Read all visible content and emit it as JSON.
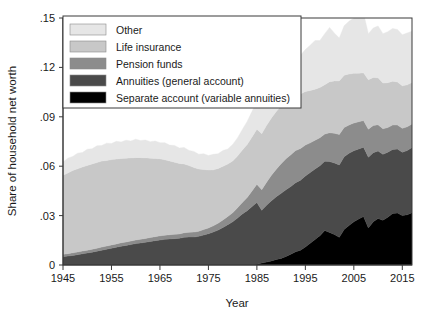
{
  "chart_data": {
    "type": "area",
    "stacked": true,
    "title": "",
    "xlabel": "Year",
    "ylabel": "Share of household net worth",
    "xlim": [
      1945,
      2017
    ],
    "ylim": [
      0,
      0.15
    ],
    "xticks": [
      1945,
      1955,
      1965,
      1975,
      1985,
      1995,
      2005,
      2015
    ],
    "xtick_labels": [
      "1945",
      "1955",
      "1965",
      "1975",
      "1985",
      "1995",
      "2005",
      "2015"
    ],
    "yticks": [
      0,
      0.03,
      0.06,
      0.09,
      0.12,
      0.15
    ],
    "ytick_labels": [
      "0",
      ".03",
      ".06",
      ".09",
      ".12",
      ".15"
    ],
    "grid": false,
    "legend_position": "top-left",
    "stack_order_bottom_to_top": [
      "Separate account (variable annuities)",
      "Annuities (general account)",
      "Pension funds",
      "Life insurance",
      "Other"
    ],
    "x": [
      1945,
      1946,
      1947,
      1948,
      1949,
      1950,
      1951,
      1952,
      1953,
      1954,
      1955,
      1956,
      1957,
      1958,
      1959,
      1960,
      1961,
      1962,
      1963,
      1964,
      1965,
      1966,
      1967,
      1968,
      1969,
      1970,
      1971,
      1972,
      1973,
      1974,
      1975,
      1976,
      1977,
      1978,
      1979,
      1980,
      1981,
      1982,
      1983,
      1984,
      1985,
      1986,
      1987,
      1988,
      1989,
      1990,
      1991,
      1992,
      1993,
      1994,
      1995,
      1996,
      1997,
      1998,
      1999,
      2000,
      2001,
      2002,
      2003,
      2004,
      2005,
      2006,
      2007,
      2008,
      2009,
      2010,
      2011,
      2012,
      2013,
      2014,
      2015,
      2016,
      2017
    ],
    "series": [
      {
        "name": "Separate account (variable annuities)",
        "color": "#000000",
        "values": [
          0,
          0,
          0,
          0,
          0,
          0,
          0,
          0,
          0,
          0,
          0,
          0,
          0,
          0,
          0,
          0,
          0,
          0,
          0,
          0,
          0,
          0,
          0,
          0,
          0,
          0,
          0,
          0,
          0,
          0,
          0,
          0,
          0,
          0,
          0,
          0,
          0,
          0,
          0,
          0,
          0.0005,
          0.0012,
          0.0018,
          0.0025,
          0.0034,
          0.004,
          0.0052,
          0.0065,
          0.008,
          0.009,
          0.011,
          0.0132,
          0.0155,
          0.0178,
          0.021,
          0.0198,
          0.0185,
          0.0168,
          0.0215,
          0.024,
          0.0262,
          0.028,
          0.0295,
          0.0225,
          0.0262,
          0.0282,
          0.0272,
          0.029,
          0.0312,
          0.0316,
          0.03,
          0.0305,
          0.0318
        ]
      },
      {
        "name": "Annuities (general account)",
        "color": "#4a4a4a",
        "values": [
          0.005,
          0.0054,
          0.0058,
          0.0063,
          0.0068,
          0.0073,
          0.0078,
          0.0084,
          0.009,
          0.0096,
          0.0102,
          0.0108,
          0.0114,
          0.0119,
          0.0124,
          0.013,
          0.0134,
          0.0138,
          0.0143,
          0.0148,
          0.0152,
          0.0156,
          0.0158,
          0.016,
          0.0162,
          0.0168,
          0.017,
          0.017,
          0.0174,
          0.0182,
          0.019,
          0.02,
          0.0212,
          0.0228,
          0.0245,
          0.0262,
          0.0285,
          0.031,
          0.033,
          0.0355,
          0.0375,
          0.032,
          0.0345,
          0.0365,
          0.038,
          0.0395,
          0.0405,
          0.0412,
          0.042,
          0.0425,
          0.043,
          0.043,
          0.0428,
          0.0425,
          0.042,
          0.043,
          0.0435,
          0.044,
          0.0442,
          0.0438,
          0.0432,
          0.0425,
          0.042,
          0.043,
          0.042,
          0.041,
          0.04,
          0.0395,
          0.039,
          0.0388,
          0.0385,
          0.039,
          0.0395
        ]
      },
      {
        "name": "Pension funds",
        "color": "#8c8c8c",
        "values": [
          0.0015,
          0.0015,
          0.0016,
          0.0016,
          0.0017,
          0.0017,
          0.0018,
          0.0018,
          0.0019,
          0.0019,
          0.002,
          0.002,
          0.0021,
          0.0021,
          0.0022,
          0.0022,
          0.0023,
          0.0023,
          0.0024,
          0.0024,
          0.0025,
          0.0025,
          0.0026,
          0.0026,
          0.0027,
          0.0028,
          0.0029,
          0.003,
          0.0031,
          0.0033,
          0.0035,
          0.0038,
          0.0042,
          0.0046,
          0.005,
          0.0055,
          0.0062,
          0.007,
          0.008,
          0.0095,
          0.011,
          0.0125,
          0.014,
          0.0155,
          0.0168,
          0.018,
          0.0188,
          0.0192,
          0.0195,
          0.0192,
          0.0188,
          0.018,
          0.0175,
          0.017,
          0.0165,
          0.0175,
          0.018,
          0.0185,
          0.0178,
          0.0172,
          0.0168,
          0.0165,
          0.0162,
          0.017,
          0.0165,
          0.016,
          0.0155,
          0.015,
          0.0148,
          0.0146,
          0.0145,
          0.0144,
          0.0143
        ]
      },
      {
        "name": "Life insurance",
        "color": "#c8c8c8",
        "values": [
          0.048,
          0.049,
          0.05,
          0.0505,
          0.051,
          0.0515,
          0.0518,
          0.052,
          0.0522,
          0.052,
          0.0518,
          0.0515,
          0.0512,
          0.0508,
          0.0505,
          0.05,
          0.0495,
          0.049,
          0.0482,
          0.0475,
          0.0468,
          0.0458,
          0.0448,
          0.0438,
          0.0428,
          0.0418,
          0.0405,
          0.0392,
          0.0378,
          0.0365,
          0.0352,
          0.034,
          0.0332,
          0.0325,
          0.0318,
          0.0315,
          0.0315,
          0.0318,
          0.0322,
          0.0328,
          0.0335,
          0.034,
          0.0345,
          0.0348,
          0.035,
          0.0352,
          0.035,
          0.0345,
          0.034,
          0.0332,
          0.0325,
          0.0318,
          0.031,
          0.0305,
          0.03,
          0.031,
          0.0318,
          0.0325,
          0.0318,
          0.031,
          0.0302,
          0.0295,
          0.029,
          0.03,
          0.0292,
          0.0285,
          0.0278,
          0.0272,
          0.0266,
          0.0262,
          0.0258,
          0.0255,
          0.0252
        ]
      },
      {
        "name": "Other",
        "color": "#e6e6e6",
        "values": [
          0.008,
          0.009,
          0.0085,
          0.0095,
          0.0088,
          0.0098,
          0.0092,
          0.0102,
          0.0095,
          0.0105,
          0.0098,
          0.0108,
          0.01,
          0.011,
          0.0102,
          0.0112,
          0.0104,
          0.0108,
          0.01,
          0.0106,
          0.0098,
          0.0104,
          0.0096,
          0.0102,
          0.0094,
          0.01,
          0.0092,
          0.0098,
          0.009,
          0.0096,
          0.0088,
          0.0094,
          0.009,
          0.0096,
          0.0092,
          0.01,
          0.011,
          0.0125,
          0.014,
          0.0155,
          0.017,
          0.0185,
          0.0175,
          0.0195,
          0.021,
          0.02,
          0.0215,
          0.023,
          0.0245,
          0.0235,
          0.0255,
          0.0275,
          0.0295,
          0.0285,
          0.031,
          0.033,
          0.029,
          0.026,
          0.03,
          0.032,
          0.0335,
          0.035,
          0.0362,
          0.028,
          0.03,
          0.0315,
          0.03,
          0.031,
          0.032,
          0.0318,
          0.031,
          0.0315,
          0.0312
        ]
      }
    ],
    "legend_entries": [
      {
        "label": "Other",
        "color": "#e6e6e6"
      },
      {
        "label": "Life insurance",
        "color": "#c8c8c8"
      },
      {
        "label": "Pension funds",
        "color": "#8c8c8c"
      },
      {
        "label": "Annuities (general account)",
        "color": "#4a4a4a"
      },
      {
        "label": "Separate account (variable annuities)",
        "color": "#000000"
      }
    ]
  },
  "axes": {
    "xlabel": "Year",
    "ylabel": "Share of household net worth"
  }
}
